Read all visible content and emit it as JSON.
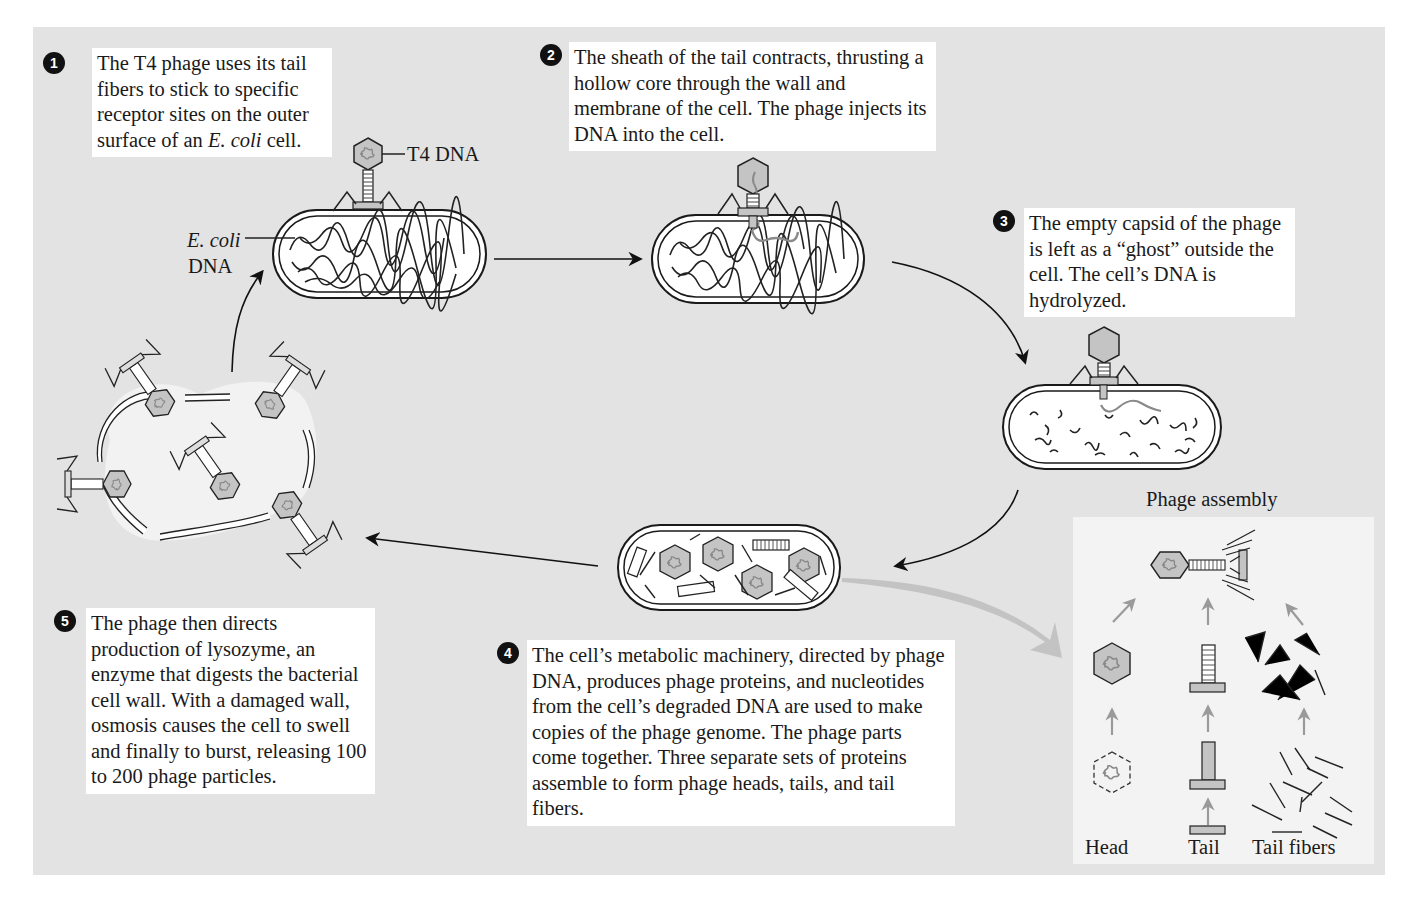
{
  "figure": {
    "colors": {
      "panel_background": "#e3e3e3",
      "text_box_background": "#ffffff",
      "assembly_box_background": "#f3f3f3",
      "capsid_fill": "#bcbcbc",
      "dna_gray": "#8a8a8a",
      "outline": "#1a1a1a",
      "gray_arrow": "#a0a0a0"
    }
  },
  "steps": [
    {
      "number": "1",
      "text_parts": [
        "The T4 phage uses its tail fibers to stick to specific receptor sites on the outer surface of an ",
        "E. coli",
        " cell."
      ]
    },
    {
      "number": "2",
      "text": "The sheath of the tail contracts, thrusting a hollow core through the wall and membrane of the cell. The phage injects its DNA into the cell."
    },
    {
      "number": "3",
      "text": "The empty capsid of the phage is left as a “ghost” outside the cell. The cell’s DNA is hydrolyzed."
    },
    {
      "number": "4",
      "text": "The cell’s metabolic machinery, directed by phage DNA, produces phage proteins, and nucleotides from the cell’s degraded DNA are used to make copies of the phage genome. The phage parts come together. Three separate sets of proteins assemble to form phage heads, tails, and tail fibers."
    },
    {
      "number": "5",
      "text": "The phage then directs production of lysozyme, an enzyme that digests the bacterial cell wall. With a damaged wall, osmosis causes the cell to swell and finally to burst, releasing 100 to 200 phage particles."
    }
  ],
  "labels": {
    "t4_dna": "T4 DNA",
    "ecoli_dna_italic": "E. coli",
    "ecoli_dna_plain": "DNA"
  },
  "phage_assembly": {
    "title": "Phage assembly",
    "columns": [
      "Head",
      "Tail",
      "Tail fibers"
    ]
  }
}
